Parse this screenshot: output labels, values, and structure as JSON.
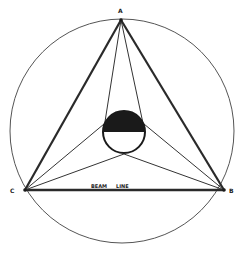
{
  "diagram": {
    "title": "",
    "colors": {
      "ink": "#2a2a2a",
      "fill": "#1a1a1a",
      "background": "#ffffff"
    },
    "points": {
      "A": {
        "label": "A",
        "x": 121,
        "y": 20
      },
      "B": {
        "label": "B",
        "x": 224,
        "y": 190
      },
      "C": {
        "label": "C",
        "x": 25,
        "y": 190
      }
    },
    "outer_circle": {
      "cx": 122,
      "cy": 131,
      "r": 112
    },
    "inner_circle": {
      "cx": 124,
      "cy": 132,
      "r": 21,
      "top_half_filled": true
    },
    "beam_line_label": "BEAM LINE",
    "labels": {
      "A": "A",
      "B": "B",
      "C": "C",
      "beam_word1": "BEAM",
      "beam_word2": "LINE"
    }
  }
}
